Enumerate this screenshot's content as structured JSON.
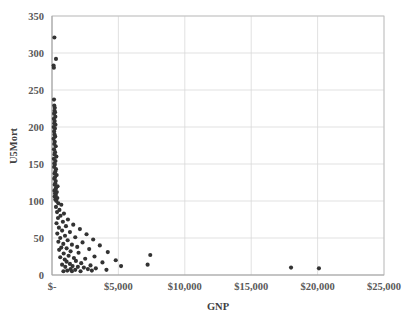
{
  "chart_data": {
    "type": "scatter",
    "title": "",
    "xlabel": "GNP",
    "ylabel": "U5Mort",
    "xlim": [
      0,
      25000
    ],
    "ylim": [
      0,
      350
    ],
    "grid": true,
    "legend": false,
    "x_tick_labels": [
      "$-",
      "$5,000",
      "$10,000",
      "$15,000",
      "$20,000",
      "$25,000"
    ],
    "x_tick_values": [
      0,
      5000,
      10000,
      15000,
      20000,
      25000
    ],
    "y_tick_labels": [
      "0",
      "50",
      "100",
      "150",
      "200",
      "250",
      "300",
      "350"
    ],
    "y_tick_values": [
      0,
      50,
      100,
      150,
      200,
      250,
      300,
      350
    ],
    "marker_color": "#333333",
    "marker_size": 3,
    "series": [
      {
        "name": "Countries",
        "points": [
          [
            180,
            321
          ],
          [
            300,
            292
          ],
          [
            120,
            283
          ],
          [
            140,
            280
          ],
          [
            150,
            237
          ],
          [
            170,
            229
          ],
          [
            210,
            226
          ],
          [
            190,
            222
          ],
          [
            230,
            220
          ],
          [
            160,
            218
          ],
          [
            250,
            214
          ],
          [
            140,
            211
          ],
          [
            200,
            208
          ],
          [
            175,
            205
          ],
          [
            260,
            203
          ],
          [
            130,
            200
          ],
          [
            220,
            198
          ],
          [
            160,
            194
          ],
          [
            190,
            190
          ],
          [
            240,
            187
          ],
          [
            120,
            184
          ],
          [
            210,
            180
          ],
          [
            170,
            177
          ],
          [
            280,
            174
          ],
          [
            150,
            170
          ],
          [
            230,
            166
          ],
          [
            190,
            163
          ],
          [
            330,
            160
          ],
          [
            140,
            157
          ],
          [
            260,
            154
          ],
          [
            180,
            151
          ],
          [
            210,
            149
          ],
          [
            160,
            146
          ],
          [
            300,
            143
          ],
          [
            250,
            140
          ],
          [
            190,
            137
          ],
          [
            350,
            135
          ],
          [
            220,
            132
          ],
          [
            170,
            130
          ],
          [
            280,
            127
          ],
          [
            240,
            124
          ],
          [
            200,
            122
          ],
          [
            420,
            120
          ],
          [
            310,
            118
          ],
          [
            260,
            116
          ],
          [
            180,
            114
          ],
          [
            360,
            112
          ],
          [
            230,
            110
          ],
          [
            290,
            108
          ],
          [
            200,
            106
          ],
          [
            400,
            104
          ],
          [
            250,
            102
          ],
          [
            330,
            100
          ],
          [
            480,
            97
          ],
          [
            700,
            95
          ],
          [
            300,
            92
          ],
          [
            560,
            88
          ],
          [
            380,
            85
          ],
          [
            900,
            83
          ],
          [
            640,
            80
          ],
          [
            450,
            77
          ],
          [
            1200,
            75
          ],
          [
            820,
            72
          ],
          [
            340,
            70
          ],
          [
            1600,
            68
          ],
          [
            1050,
            66
          ],
          [
            520,
            64
          ],
          [
            2100,
            62
          ],
          [
            760,
            60
          ],
          [
            1350,
            58
          ],
          [
            400,
            56
          ],
          [
            2600,
            55
          ],
          [
            980,
            53
          ],
          [
            1750,
            51
          ],
          [
            620,
            50
          ],
          [
            3100,
            48
          ],
          [
            1180,
            47
          ],
          [
            480,
            45
          ],
          [
            2300,
            44
          ],
          [
            850,
            42
          ],
          [
            1500,
            41
          ],
          [
            3600,
            40
          ],
          [
            1900,
            38
          ],
          [
            700,
            37
          ],
          [
            1100,
            36
          ],
          [
            2800,
            35
          ],
          [
            540,
            34
          ],
          [
            1400,
            32
          ],
          [
            4200,
            31
          ],
          [
            2000,
            30
          ],
          [
            880,
            29
          ],
          [
            7400,
            27
          ],
          [
            1250,
            26
          ],
          [
            3200,
            25
          ],
          [
            620,
            24
          ],
          [
            1650,
            23
          ],
          [
            2500,
            22
          ],
          [
            960,
            21
          ],
          [
            4800,
            20
          ],
          [
            1800,
            19
          ],
          [
            1100,
            18
          ],
          [
            3800,
            17
          ],
          [
            2200,
            16
          ],
          [
            1350,
            15
          ],
          [
            7200,
            14
          ],
          [
            760,
            14
          ],
          [
            2900,
            13
          ],
          [
            1550,
            12
          ],
          [
            5200,
            12
          ],
          [
            1950,
            11
          ],
          [
            1000,
            11
          ],
          [
            18000,
            10
          ],
          [
            2400,
            10
          ],
          [
            20100,
            9
          ],
          [
            3300,
            9
          ],
          [
            1400,
            8
          ],
          [
            2700,
            8
          ],
          [
            1750,
            7
          ],
          [
            4100,
            7
          ],
          [
            1150,
            6
          ],
          [
            3000,
            6
          ],
          [
            2150,
            5
          ],
          [
            1500,
            5
          ],
          [
            860,
            5
          ]
        ]
      }
    ]
  }
}
